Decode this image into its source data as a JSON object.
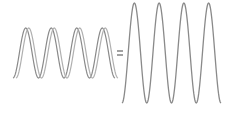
{
  "diagram": {
    "left_waves": {
      "count": 2,
      "cycles": 4,
      "x_start": 13,
      "x_end": 115,
      "y_center": 53,
      "amplitude": 25,
      "phase_offset_px": 3,
      "colors": [
        "#8a8a8a",
        "#b0b0b0"
      ]
    },
    "operator": {
      "symbol": "=",
      "x": 117,
      "y": 53,
      "color": "#707070"
    },
    "result_wave": {
      "cycles": 4,
      "x_start": 122,
      "x_end": 221,
      "y_center": 53,
      "amplitude": 50,
      "color": "#8a8a8a"
    }
  }
}
